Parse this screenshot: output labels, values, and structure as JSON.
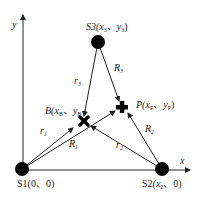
{
  "axes": {
    "x_label": "x",
    "y_label": "y"
  },
  "stations": [
    {
      "id": "S1",
      "label": "S1(0、0)",
      "name": "S1",
      "coords": "(0、0)"
    },
    {
      "id": "S2",
      "label": "S2(x2、0)",
      "name": "S2",
      "coords_prefix": "(x",
      "coords_sub": "2",
      "coords_suffix": "、0)"
    },
    {
      "id": "S3",
      "label": "S3(x3、y3)",
      "name": "S3",
      "coords_prefix": "(x",
      "coords_sub1": "3",
      "coords_mid": "、y",
      "coords_sub2": "3",
      "coords_suffix": ")"
    }
  ],
  "points": {
    "B": {
      "name": "B",
      "prefix": "(x",
      "sub1": "B",
      "mid": "、y",
      "sub2": "B",
      "suffix": "",
      "marker": "x-mark"
    },
    "P": {
      "name": "P",
      "prefix": "(x",
      "sub1": "P",
      "mid": "、y",
      "sub2": "P",
      "suffix": ")",
      "marker": "plus-mark"
    }
  },
  "distances": {
    "r1": {
      "base": "r",
      "sub": "1"
    },
    "r2": {
      "base": "r",
      "sub": "2"
    },
    "r3": {
      "base": "r",
      "sub": "3"
    },
    "R1": {
      "base": "R",
      "sub": "1"
    },
    "R2": {
      "base": "R",
      "sub": "2"
    },
    "R3": {
      "base": "R",
      "sub": "3"
    }
  },
  "colors": {
    "line": "#222222",
    "node": "#000000",
    "background": "#ffffff"
  }
}
